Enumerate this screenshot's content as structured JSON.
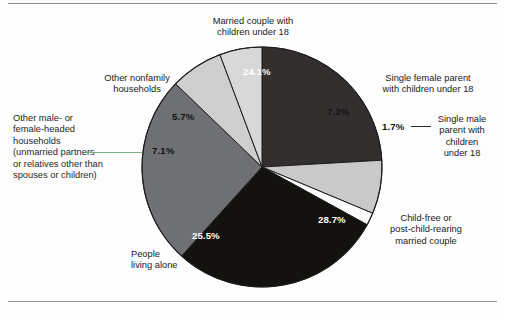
{
  "chart_data": {
    "type": "pie",
    "title": "",
    "subtitle": "",
    "xlabel": "",
    "ylabel": "",
    "legend_position": "callout-labels",
    "grid": false,
    "units": "percent",
    "categories": [
      "Married couple with children under 18",
      "Single female parent with children under 18",
      "Single male parent with children under 18",
      "Child-free or post-child-rearing married couple",
      "People living alone",
      "Other male- or female-headed households (unmarried partners or relatives other than spouses or children)",
      "Other nonfamily households"
    ],
    "values": [
      24.1,
      7.2,
      1.7,
      28.7,
      25.5,
      7.1,
      5.7
    ],
    "value_labels": [
      "24.1%",
      "7.2%",
      "1.7%",
      "28.7%",
      "25.5%",
      "7.1%",
      "5.7%"
    ],
    "colors": [
      "#332f2f",
      "#c9c9c9",
      "#fbfbfb",
      "#14120f",
      "#6f7074",
      "#cfcfcf",
      "#d8d8d8"
    ],
    "slices": [
      {
        "id": "married-couple-children",
        "label": "Married couple with\nchildren under 18",
        "value": 24.1,
        "value_label": "24.1%",
        "color": "#332f2f",
        "label_text_color": "#ffffff"
      },
      {
        "id": "single-female-parent",
        "label": "Single female parent\nwith children under 18",
        "value": 7.2,
        "value_label": "7.2%",
        "color": "#c9c9c9",
        "label_text_color": "#111111"
      },
      {
        "id": "single-male-parent",
        "label": "Single male\nparent with\nchildren\nunder 18",
        "value": 1.7,
        "value_label": "1.7%",
        "color": "#fbfbfb",
        "label_text_color": "#111111"
      },
      {
        "id": "child-free-married-couple",
        "label": "Child-free or\npost-child-rearing\nmarried couple",
        "value": 28.7,
        "value_label": "28.7%",
        "color": "#14120f",
        "label_text_color": "#ffffff"
      },
      {
        "id": "people-living-alone",
        "label": "People\nliving alone",
        "value": 25.5,
        "value_label": "25.5%",
        "color": "#6f7074",
        "label_text_color": "#ffffff"
      },
      {
        "id": "other-male-female-headed",
        "label": "Other male- or\nfemale-headed\nhouseholds\n(unmarried partners\nor relatives other than\nspouses or children)",
        "value": 7.1,
        "value_label": "7.1%",
        "color": "#cfcfcf",
        "label_text_color": "#111111"
      },
      {
        "id": "other-nonfamily-households",
        "label": "Other nonfamily\nhouseholds",
        "value": 5.7,
        "value_label": "5.7%",
        "color": "#d8d8d8",
        "label_text_color": "#111111"
      }
    ]
  },
  "figure": {
    "background_color": "#ffffff",
    "outline_color": "#1d1d1d",
    "leader_line_color": "#7fae7f",
    "rule_color": "#8d8d8d"
  }
}
